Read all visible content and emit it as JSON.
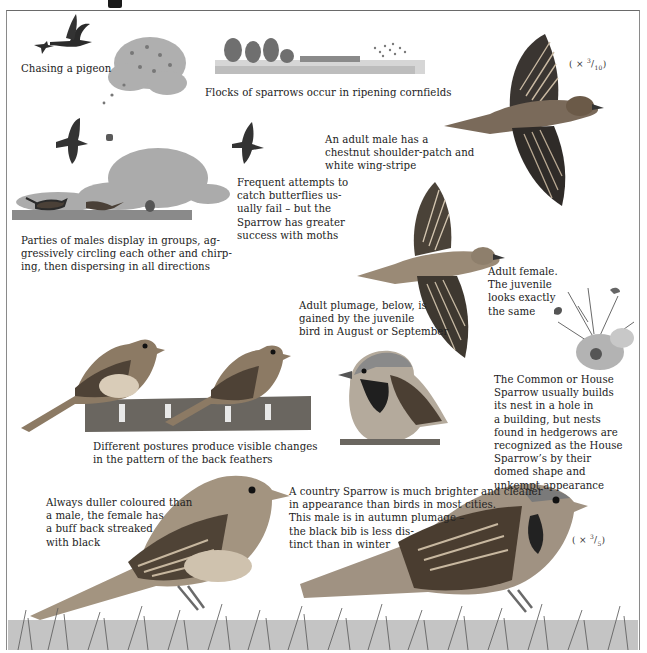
{
  "page": {
    "subject": "House Sparrow",
    "colors": {
      "ink": "#1e1e1e",
      "frame": "#7a7a7a",
      "bird_dark": "#2b2b2b",
      "bird_brown": "#6b5a48",
      "bird_buff": "#c9b9a2",
      "foliage": "#9a9a9a",
      "grass": "#5f5f5f",
      "background": "#ffffff"
    }
  },
  "captions": {
    "chasing_pigeon": "Chasing a pigeon",
    "flocks_cornfields": "Flocks of sparrows occur in ripening cornfields",
    "adult_male": "An adult male has a\nchestnut shoulder-patch and\nwhite wing-stripe",
    "butterflies": "Frequent attempts to\ncatch butterflies us-\nually fail – but the\nSparrow has greater\nsuccess with moths",
    "parties_display": "Parties of males display in groups, ag-\ngressively circling each other and chirp-\ning, then dispersing in all directions",
    "adult_plumage": "Adult plumage, below, is\ngained by the juvenile\nbird in August or September",
    "adult_female": "Adult female.\nThe juvenile\nlooks exactly\nthe same",
    "nest": "The Common or House\nSparrow usually builds\nits nest in a hole in\na building, but nests\nfound in hedgerows are\nrecognized as the House\nSparrow’s by their\ndomed shape and\nunkempt appearance",
    "postures": "Different postures produce visible changes\nin the pattern of the back feathers",
    "female_duller": "Always duller coloured than\na male, the female has\na buff back streaked\nwith black",
    "country_sparrow": "A country Sparrow is much brighter and cleaner\nin appearance than birds in most cities.\nThis male is in autumn plumage –\nthe black bib is less dis-\ntinct than in winter"
  },
  "scales": {
    "top": {
      "prefix": "( × ",
      "num": "3",
      "den": "10",
      "suffix": ")"
    },
    "bottom": {
      "prefix": "( × ",
      "num": "3",
      "den": "5",
      "suffix": ")"
    }
  },
  "illustrations": [
    {
      "id": "sparrow-chasing-pigeon",
      "label": "sparrow chasing pigeon silhouettes"
    },
    {
      "id": "flock-bush",
      "label": "flock of sparrows over bush"
    },
    {
      "id": "cornfield-landscape",
      "label": "cornfield with trees and flock"
    },
    {
      "id": "male-flying",
      "label": "adult male sparrow in flight"
    },
    {
      "id": "males-display-scene",
      "label": "males displaying on ground"
    },
    {
      "id": "butterfly-chase",
      "label": "sparrow chasing butterfly"
    },
    {
      "id": "female-flying",
      "label": "adult female sparrow in flight"
    },
    {
      "id": "hedgerow-nest",
      "label": "domed nest in hedgerow"
    },
    {
      "id": "juveniles-on-post",
      "label": "two juveniles perched on post"
    },
    {
      "id": "male-perched",
      "label": "male sparrow perched"
    },
    {
      "id": "female-ground",
      "label": "female sparrow on grass"
    },
    {
      "id": "male-ground",
      "label": "country male sparrow on grass"
    },
    {
      "id": "grass-foreground",
      "label": "grass foreground"
    }
  ]
}
